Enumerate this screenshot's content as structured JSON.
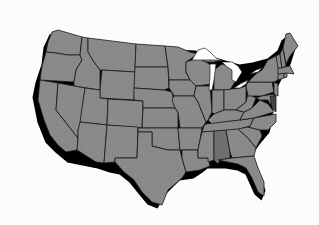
{
  "map": {
    "title": "United States (contiguous) state map",
    "region": "Contiguous United States",
    "highlighted_state": "Alabama",
    "colors": {
      "background": "#fcfcfc",
      "state_fill": "#8a8a8a",
      "highlight_fill": "#6f6f6f",
      "border": "#1a1a1a",
      "shadow": "#000000",
      "lakes": "#ffffff"
    },
    "states": [
      "Washington",
      "Oregon",
      "California",
      "Idaho",
      "Nevada",
      "Montana",
      "Wyoming",
      "Utah",
      "Arizona",
      "Colorado",
      "New Mexico",
      "North Dakota",
      "South Dakota",
      "Nebraska",
      "Kansas",
      "Oklahoma",
      "Texas",
      "Minnesota",
      "Iowa",
      "Missouri",
      "Arkansas",
      "Louisiana",
      "Wisconsin",
      "Illinois",
      "Michigan",
      "Indiana",
      "Ohio",
      "Kentucky",
      "Tennessee",
      "Mississippi",
      "Alabama",
      "Georgia",
      "Florida",
      "South Carolina",
      "North Carolina",
      "Virginia",
      "West Virginia",
      "Pennsylvania",
      "New York",
      "Maryland",
      "Delaware",
      "New Jersey",
      "Connecticut",
      "Rhode Island",
      "Massachusetts",
      "Vermont",
      "New Hampshire",
      "Maine"
    ],
    "features": [
      "Great Lakes"
    ]
  }
}
